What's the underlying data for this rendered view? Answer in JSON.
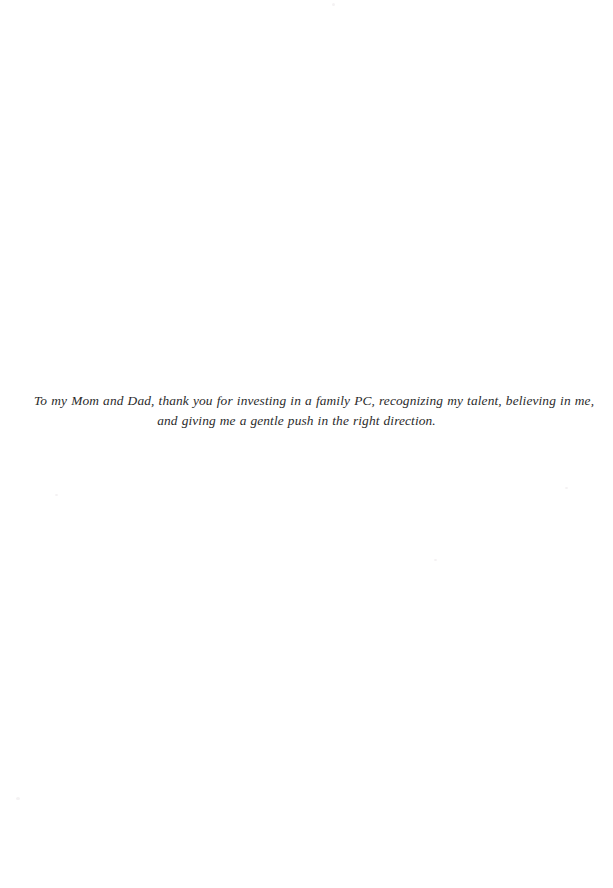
{
  "page": {
    "kind": "book-dedication-page",
    "width": 613,
    "height": 888,
    "background_color": "#ffffff",
    "text_color": "#2b2b2b"
  },
  "dedication": {
    "line_1": "To my Mom and Dad, thank you for investing in a family PC, recognizing my talent, believing in me,",
    "line_2": "and giving me a gentle push in the right direction.",
    "full_text": "To my Mom and Dad, thank you for investing in a family PC, recognizing my talent, believing in me, and giving me a gentle push in the right direction."
  }
}
